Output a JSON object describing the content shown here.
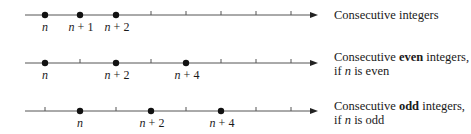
{
  "rows": [
    {
      "description": [
        "Consecutive integers"
      ],
      "description_parts": {
        "pre": "Consecutive ",
        "bold": "",
        "post": "integers"
      },
      "condition": "",
      "points": [
        {
          "label": "n",
          "pos": 1
        },
        {
          "label": "n + 1",
          "pos": 2
        },
        {
          "label": "n + 2",
          "pos": 3
        }
      ]
    },
    {
      "description_parts": {
        "pre": "Consecutive ",
        "bold": "even",
        "post": " integers,"
      },
      "condition": {
        "pre": "if ",
        "var": "n",
        "post": " is even"
      },
      "points": [
        {
          "label": "n",
          "pos": 1
        },
        {
          "label": "n + 2",
          "pos": 3
        },
        {
          "label": "n + 4",
          "pos": 5
        }
      ]
    },
    {
      "description_parts": {
        "pre": "Consecutive ",
        "bold": "odd",
        "post": " integers,"
      },
      "condition": {
        "pre": "if ",
        "var": "n",
        "post": " is odd"
      },
      "points": [
        {
          "label": "n",
          "pos": 2
        },
        {
          "label": "n + 2",
          "pos": 4
        },
        {
          "label": "n + 4",
          "pos": 6
        }
      ]
    }
  ],
  "labels": {
    "n": "n",
    "plus1": "+ 1",
    "plus2": "+ 2",
    "plus4": "+ 4"
  },
  "colors": {
    "line": "#555555",
    "dot": "#111111",
    "text": "#1a1a1a"
  }
}
